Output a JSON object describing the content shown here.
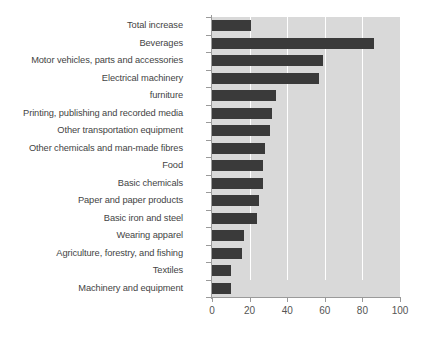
{
  "chart": {
    "type": "bar",
    "orientation": "horizontal",
    "title": "",
    "xlabel": "",
    "ylabel": "",
    "plot_background": "#d9d9d9",
    "bar_color": "#3a3a3a",
    "gridline_color": "#ffffff",
    "axis_color": "#9a9a9a",
    "grid": "vertical",
    "legend": "none"
  },
  "chart_data": {
    "type": "bar",
    "title": "",
    "xlabel": "",
    "ylabel": "",
    "xlim": [
      0,
      100
    ],
    "xticks": [
      "0",
      "20",
      "40",
      "60",
      "80",
      "100"
    ],
    "categories": [
      "Total increase",
      "Beverages",
      "Motor vehicles, parts and accessories",
      "Electrical machinery",
      "furniture",
      "Printing, publishing and recorded media",
      "Other transportation equipment",
      "Other chemicals and man-made fibres",
      "Food",
      "Basic chemicals",
      "Paper and paper products",
      "Basic iron and steel",
      "Wearing apparel",
      "Agriculture, forestry, and fishing",
      "Textiles",
      "Machinery and equipment"
    ],
    "values": [
      21,
      86,
      59,
      57,
      34,
      32,
      31,
      28,
      27,
      27,
      25,
      24,
      17,
      16,
      10,
      10
    ],
    "grid": true,
    "legend_position": "none"
  }
}
